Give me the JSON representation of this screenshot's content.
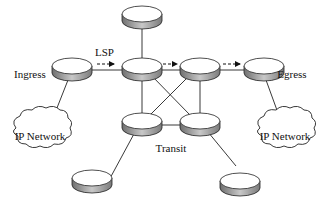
{
  "diagram": {
    "labels": {
      "lsp": "LSP",
      "ingress": "Ingress",
      "egress": "Egress",
      "transit": "Transit",
      "cloud_left": "IP Network",
      "cloud_right": "IP Network"
    },
    "nodes": [
      {
        "id": "top",
        "type": "router",
        "x": 142,
        "y": 14
      },
      {
        "id": "ingress",
        "type": "router",
        "x": 72,
        "y": 66
      },
      {
        "id": "r1",
        "type": "router",
        "x": 142,
        "y": 66
      },
      {
        "id": "r2",
        "type": "router",
        "x": 200,
        "y": 66
      },
      {
        "id": "egress",
        "type": "router",
        "x": 264,
        "y": 66
      },
      {
        "id": "transit-left",
        "type": "router",
        "x": 142,
        "y": 121
      },
      {
        "id": "transit-right",
        "type": "router",
        "x": 200,
        "y": 121
      },
      {
        "id": "bottom-left",
        "type": "router",
        "x": 92,
        "y": 178
      },
      {
        "id": "bottom-right",
        "type": "router",
        "x": 240,
        "y": 181
      },
      {
        "id": "ip-network-left",
        "type": "cloud",
        "x": 38,
        "y": 136
      },
      {
        "id": "ip-network-right",
        "type": "cloud",
        "x": 284,
        "y": 136
      }
    ],
    "edges": [
      [
        "top",
        "r1"
      ],
      [
        "ingress",
        "r1"
      ],
      [
        "r1",
        "r2"
      ],
      [
        "r2",
        "egress"
      ],
      [
        "r1",
        "transit-left"
      ],
      [
        "r2",
        "transit-right"
      ],
      [
        "r1",
        "transit-right"
      ],
      [
        "r2",
        "transit-left"
      ],
      [
        "transit-left",
        "transit-right"
      ],
      [
        "ingress",
        "ip-network-left"
      ],
      [
        "egress",
        "ip-network-right"
      ],
      [
        "transit-left",
        "bottom-left"
      ],
      [
        "transit-right",
        "bottom-right"
      ]
    ],
    "lsp_arrows": [
      {
        "from": "ingress",
        "to": "r1"
      },
      {
        "from": "r1",
        "to": "r2"
      },
      {
        "from": "r2",
        "to": "egress"
      }
    ]
  }
}
